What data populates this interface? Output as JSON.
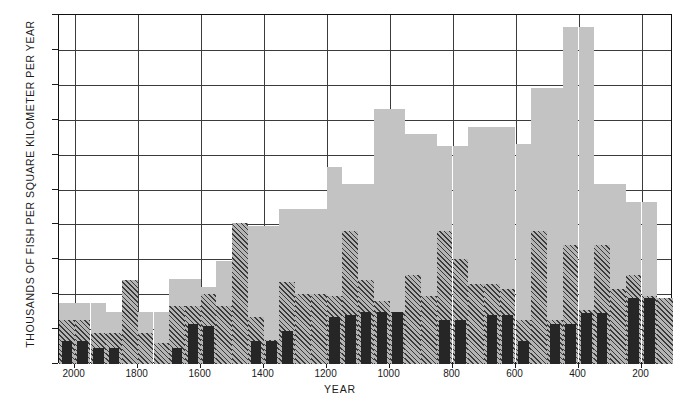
{
  "chart_data": {
    "type": "bar",
    "title": "",
    "xlabel": "YEAR",
    "ylabel": "THOUSANDS OF FISH PER SQUARE KILOMETER PER YEAR",
    "ylim": [
      0,
      200
    ],
    "xlim": [
      2050,
      100
    ],
    "y_ticks": [
      0,
      20,
      40,
      60,
      80,
      100,
      120,
      140,
      160,
      180,
      200
    ],
    "x_ticks": [
      2000,
      1800,
      1600,
      1400,
      1200,
      1000,
      800,
      600,
      400,
      200
    ],
    "grid": true,
    "legend": "none",
    "x_reversed": true,
    "bin_width": 50,
    "categories": [
      2025,
      1975,
      1925,
      1875,
      1825,
      1775,
      1725,
      1675,
      1625,
      1575,
      1525,
      1475,
      1425,
      1375,
      1325,
      1275,
      1225,
      1175,
      1125,
      1075,
      1025,
      975,
      925,
      875,
      825,
      775,
      725,
      675,
      625,
      575,
      525,
      475,
      425,
      375,
      325,
      275,
      225,
      175,
      125
    ],
    "series": [
      {
        "name": "total",
        "style": "light-gray-solid",
        "color": "#c3c3c3",
        "values": [
          35,
          35,
          35,
          30,
          48,
          30,
          30,
          49,
          49,
          44,
          59,
          81,
          79,
          79,
          89,
          89,
          89,
          113,
          103,
          103,
          146,
          146,
          132,
          132,
          125,
          125,
          136,
          136,
          136,
          126,
          158,
          158,
          193,
          193,
          103,
          103,
          93,
          93,
          38
        ]
      },
      {
        "name": "middle",
        "style": "diagonal-hatch",
        "color": "#3a3a3a",
        "values": [
          25,
          25,
          18,
          18,
          48,
          18,
          12,
          33,
          33,
          40,
          33,
          81,
          27,
          14,
          47,
          40,
          40,
          39,
          76,
          48,
          36,
          30,
          51,
          39,
          76,
          60,
          46,
          46,
          43,
          25,
          76,
          25,
          68,
          31,
          68,
          43,
          51,
          39,
          38
        ]
      },
      {
        "name": "lowest",
        "style": "dark-solid",
        "color": "#262626",
        "values": [
          13,
          13,
          9,
          9,
          0,
          0,
          0,
          9,
          23,
          22,
          0,
          0,
          13,
          13,
          19,
          0,
          0,
          27,
          28,
          30,
          30,
          30,
          0,
          0,
          25,
          25,
          0,
          28,
          28,
          13,
          0,
          23,
          23,
          29,
          29,
          0,
          38,
          38,
          0
        ]
      }
    ]
  }
}
